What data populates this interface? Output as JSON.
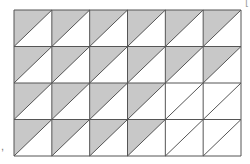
{
  "figure": {
    "rows": 4,
    "columns": 6,
    "grid": {
      "left": 14,
      "right": 241,
      "top": 10,
      "bottom": 156
    },
    "diagonal": "bottom-left-to-top-right",
    "shaded_half": "upper-left",
    "shaded_cells_per_row": [
      6,
      6,
      4,
      4
    ],
    "total_triangles": 48,
    "shaded_triangles": 20,
    "colors": {
      "shade": "#c8c8c8",
      "line": "#555555",
      "background": "#ffffff"
    }
  },
  "labels": {
    "corner": "[",
    "side": ","
  }
}
